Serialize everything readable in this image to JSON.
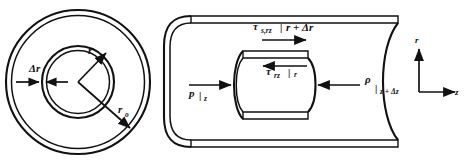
{
  "figure": {
    "background_color": "#ffffff",
    "ink_color": "#111111",
    "width": 464,
    "height": 165
  },
  "cross_section": {
    "name": "Pipe cross-section view",
    "labels": {
      "delta_r": "Δr",
      "inner_radius": "r",
      "outer_radius": "r",
      "outer_radius_sub": "o"
    },
    "annotations": [
      {
        "id": "delta-r",
        "text": "Δr",
        "meaning": "radial shell thickness"
      },
      {
        "id": "radius-r",
        "text": "r",
        "meaning": "inner shell radius arrow"
      },
      {
        "id": "radius-ro",
        "text": "ro",
        "meaning": "pipe outer radius arrow"
      }
    ]
  },
  "pipe_view": {
    "name": "Pipe cutaway with shell element",
    "stress_top": {
      "symbol": "τ",
      "subscript": "s,rz",
      "evaluated_at": "r + Δr",
      "bar": "|",
      "arrow_direction": "right"
    },
    "stress_inner": {
      "symbol": "τ",
      "subscript": "rz",
      "evaluated_at": "r",
      "bar": "|",
      "arrow_direction": "left"
    },
    "pressure_left": {
      "symbol": "p",
      "bar": "|",
      "evaluated_at": "z",
      "arrow_direction": "right"
    },
    "pressure_right": {
      "symbol": "ρ",
      "bar": "|",
      "evaluated_at": "z + Δz",
      "arrow_direction": "left"
    },
    "axes": {
      "vertical_label": "r",
      "horizontal_label": "z"
    }
  }
}
